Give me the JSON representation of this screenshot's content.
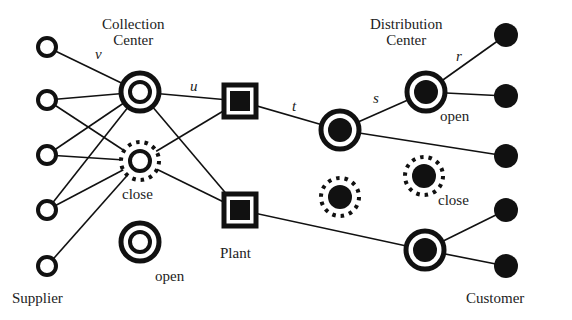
{
  "labels": {
    "collection_center": [
      "Collection",
      "Center"
    ],
    "distribution_center": [
      "Distribution",
      "Center"
    ],
    "supplier": "Supplier",
    "plant": "Plant",
    "customer": "Customer",
    "open_cc": "open",
    "close_cc": "close",
    "open_dc": "open",
    "close_dc": "close",
    "edge_v": "v",
    "edge_u": "u",
    "edge_t": "t",
    "edge_s": "s",
    "edge_r": "r"
  },
  "colors": {
    "ink": "#111111",
    "background": "#ffffff"
  },
  "nodes": {
    "suppliers": [
      {
        "x": 47,
        "y": 47
      },
      {
        "x": 47,
        "y": 100
      },
      {
        "x": 47,
        "y": 155
      },
      {
        "x": 47,
        "y": 210
      },
      {
        "x": 47,
        "y": 266
      }
    ],
    "collection_centers": [
      {
        "x": 140,
        "y": 92,
        "state": "open"
      },
      {
        "x": 140,
        "y": 161,
        "state": "close"
      },
      {
        "x": 140,
        "y": 242,
        "state": "open"
      }
    ],
    "plants": [
      {
        "x": 240,
        "y": 101
      },
      {
        "x": 240,
        "y": 210
      }
    ],
    "distribution_centers": [
      {
        "x": 340,
        "y": 130,
        "state": "open"
      },
      {
        "x": 426,
        "y": 92,
        "state": "open"
      },
      {
        "x": 340,
        "y": 197,
        "state": "close"
      },
      {
        "x": 424,
        "y": 176,
        "state": "close"
      },
      {
        "x": 425,
        "y": 250,
        "state": "open"
      }
    ],
    "customers": [
      {
        "x": 506,
        "y": 35
      },
      {
        "x": 506,
        "y": 96
      },
      {
        "x": 506,
        "y": 156
      },
      {
        "x": 506,
        "y": 210
      },
      {
        "x": 506,
        "y": 266
      }
    ]
  },
  "edges": [
    [
      "S1",
      "CC1"
    ],
    [
      "S2",
      "CC1"
    ],
    [
      "S2",
      "CC2"
    ],
    [
      "S3",
      "CC1"
    ],
    [
      "S3",
      "CC2"
    ],
    [
      "S4",
      "CC1"
    ],
    [
      "S4",
      "CC2"
    ],
    [
      "S5",
      "CC2"
    ],
    [
      "CC1",
      "P1"
    ],
    [
      "CC1",
      "P2"
    ],
    [
      "CC2",
      "P1"
    ],
    [
      "CC2",
      "P2"
    ],
    [
      "P1",
      "DC1"
    ],
    [
      "P2",
      "DC5"
    ],
    [
      "DC1",
      "DC2"
    ],
    [
      "DC1",
      "C3"
    ],
    [
      "DC2",
      "C1"
    ],
    [
      "DC2",
      "C2"
    ],
    [
      "DC5",
      "C4"
    ],
    [
      "DC5",
      "C5"
    ]
  ]
}
